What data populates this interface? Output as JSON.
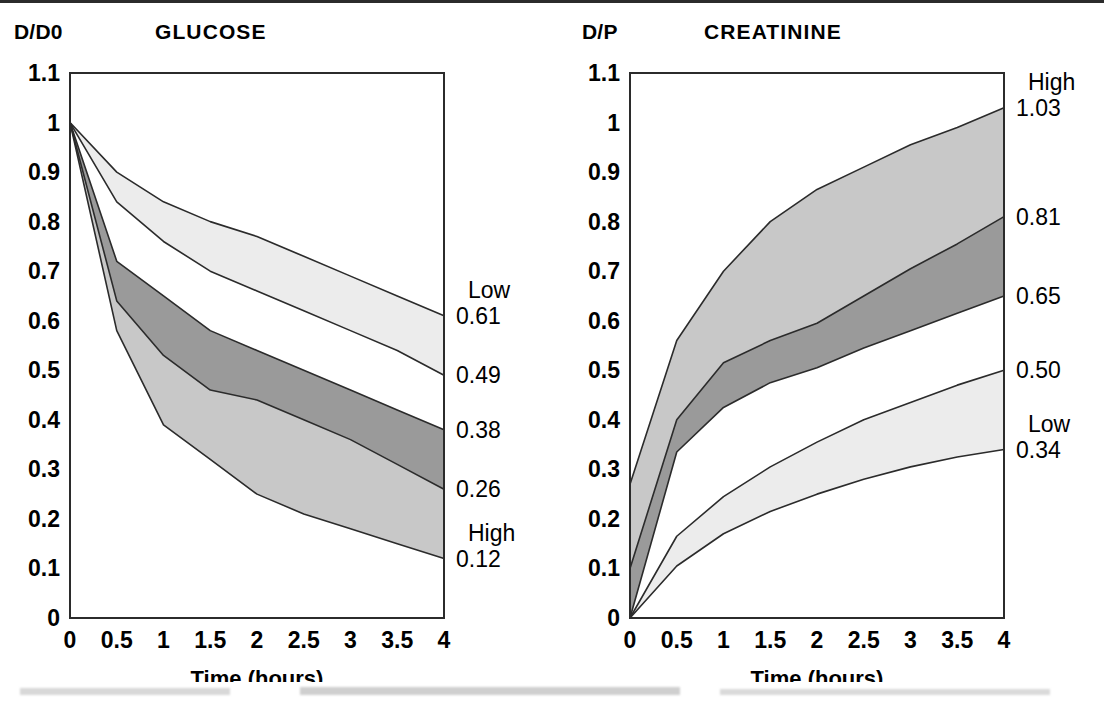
{
  "figure": {
    "x_axis_label": "Time (hours)",
    "x_ticks": [
      "0",
      "0.5",
      "1",
      "1.5",
      "2",
      "2.5",
      "3",
      "3.5",
      "4"
    ],
    "y_ticks": [
      "1.1",
      "1",
      "0.9",
      "0.8",
      "0.7",
      "0.6",
      "0.5",
      "0.4",
      "0.3",
      "0.2",
      "0.1",
      "0"
    ],
    "colors": {
      "ink": "#000000",
      "band_light": "#ececec",
      "band_mid": "#c8c8c8",
      "band_dark": "#9a9a9a",
      "outline": "#2b2b2b",
      "background": "#ffffff"
    }
  },
  "panels": {
    "glucose": {
      "unit_label": "D/D0",
      "title": "GLUCOSE",
      "x_axis_label": "Time (hours)",
      "end_labels": [
        {
          "name": "low-word",
          "text": "Low",
          "value": 0.61,
          "kind": "word"
        },
        {
          "name": "low-value",
          "text": "0.61",
          "value": 0.61,
          "kind": "value"
        },
        {
          "name": "v-049",
          "text": "0.49",
          "value": 0.49,
          "kind": "value"
        },
        {
          "name": "v-038",
          "text": "0.38",
          "value": 0.38,
          "kind": "value"
        },
        {
          "name": "v-026",
          "text": "0.26",
          "value": 0.26,
          "kind": "value"
        },
        {
          "name": "high-word",
          "text": "High",
          "value": 0.12,
          "kind": "word"
        },
        {
          "name": "high-value",
          "text": "0.12",
          "value": 0.12,
          "kind": "value"
        }
      ]
    },
    "creatinine": {
      "unit_label": "D/P",
      "title": "CREATININE",
      "x_axis_label": "Time (hours)",
      "end_labels": [
        {
          "name": "high-word",
          "text": "High",
          "value": 1.03,
          "kind": "word"
        },
        {
          "name": "high-value",
          "text": "1.03",
          "value": 1.03,
          "kind": "value"
        },
        {
          "name": "v-081",
          "text": "0.81",
          "value": 0.81,
          "kind": "value"
        },
        {
          "name": "v-065",
          "text": "0.65",
          "value": 0.65,
          "kind": "value"
        },
        {
          "name": "v-050",
          "text": "0.50",
          "value": 0.5,
          "kind": "value"
        },
        {
          "name": "low-word",
          "text": "Low",
          "value": 0.34,
          "kind": "word"
        },
        {
          "name": "low-value",
          "text": "0.34",
          "value": 0.34,
          "kind": "value"
        }
      ]
    }
  },
  "chart_data": [
    {
      "type": "area",
      "id": "glucose",
      "title": "GLUCOSE",
      "ylabel": "D/D0",
      "xlabel": "Time (hours)",
      "x": [
        0,
        0.5,
        1,
        1.5,
        2,
        2.5,
        3,
        3.5,
        4
      ],
      "xlim": [
        0,
        4
      ],
      "ylim": [
        0,
        1.1
      ],
      "grid": false,
      "legend": "right-edge-annotations",
      "series": [
        {
          "name": "Low",
          "values": [
            1.0,
            0.9,
            0.84,
            0.8,
            0.77,
            0.73,
            0.69,
            0.65,
            0.61
          ],
          "boundary": "upper"
        },
        {
          "name": "Low-average",
          "values": [
            1.0,
            0.84,
            0.76,
            0.7,
            0.66,
            0.62,
            0.58,
            0.54,
            0.49
          ],
          "boundary": "upper-mid"
        },
        {
          "name": "High-average",
          "values": [
            1.0,
            0.72,
            0.65,
            0.58,
            0.54,
            0.5,
            0.46,
            0.42,
            0.38
          ],
          "boundary": "lower-mid"
        },
        {
          "name": "High",
          "values": [
            1.0,
            0.64,
            0.53,
            0.46,
            0.44,
            0.4,
            0.36,
            0.31,
            0.26
          ],
          "boundary": "lower"
        },
        {
          "name": "High-extreme",
          "values": [
            1.0,
            0.58,
            0.39,
            0.32,
            0.25,
            0.21,
            0.18,
            0.15,
            0.12
          ],
          "boundary": "lowest"
        }
      ],
      "bands": [
        {
          "name": "low-band",
          "between": [
            "Low",
            "Low-average"
          ],
          "fill": "#ececec"
        },
        {
          "name": "mid-band",
          "between": [
            "High-average",
            "High"
          ],
          "fill": "#9a9a9a"
        },
        {
          "name": "high-band",
          "between": [
            "High",
            "High-extreme"
          ],
          "fill": "#c8c8c8"
        }
      ],
      "end_values": {
        "Low": 0.61,
        "Low-average": 0.49,
        "High-average": 0.38,
        "High": 0.26,
        "High-extreme": 0.12
      }
    },
    {
      "type": "area",
      "id": "creatinine",
      "title": "CREATININE",
      "ylabel": "D/P",
      "xlabel": "Time (hours)",
      "x": [
        0,
        0.5,
        1,
        1.5,
        2,
        2.5,
        3,
        3.5,
        4
      ],
      "xlim": [
        0,
        4
      ],
      "ylim": [
        0,
        1.1
      ],
      "grid": false,
      "legend": "right-edge-annotations",
      "series": [
        {
          "name": "High",
          "values": [
            0.27,
            0.56,
            0.7,
            0.8,
            0.865,
            0.91,
            0.955,
            0.99,
            1.03
          ],
          "boundary": "upper"
        },
        {
          "name": "High-average",
          "values": [
            0.1,
            0.4,
            0.515,
            0.56,
            0.595,
            0.65,
            0.705,
            0.755,
            0.81
          ],
          "boundary": "upper-mid"
        },
        {
          "name": "Average",
          "values": [
            0.0,
            0.335,
            0.425,
            0.475,
            0.505,
            0.545,
            0.58,
            0.615,
            0.65
          ],
          "boundary": "lower-mid"
        },
        {
          "name": "Low-average",
          "values": [
            0.0,
            0.165,
            0.245,
            0.305,
            0.355,
            0.4,
            0.435,
            0.47,
            0.5
          ],
          "boundary": "lower"
        },
        {
          "name": "Low",
          "values": [
            0.0,
            0.105,
            0.17,
            0.215,
            0.25,
            0.28,
            0.305,
            0.325,
            0.34
          ],
          "boundary": "lowest"
        }
      ],
      "bands": [
        {
          "name": "high-band",
          "between": [
            "High",
            "High-average"
          ],
          "fill": "#c8c8c8"
        },
        {
          "name": "mid-band",
          "between": [
            "High-average",
            "Average"
          ],
          "fill": "#9a9a9a"
        },
        {
          "name": "low-band",
          "between": [
            "Low-average",
            "Low"
          ],
          "fill": "#ececec"
        }
      ],
      "end_values": {
        "High": 1.03,
        "High-average": 0.81,
        "Average": 0.65,
        "Low-average": 0.5,
        "Low": 0.34
      }
    }
  ]
}
